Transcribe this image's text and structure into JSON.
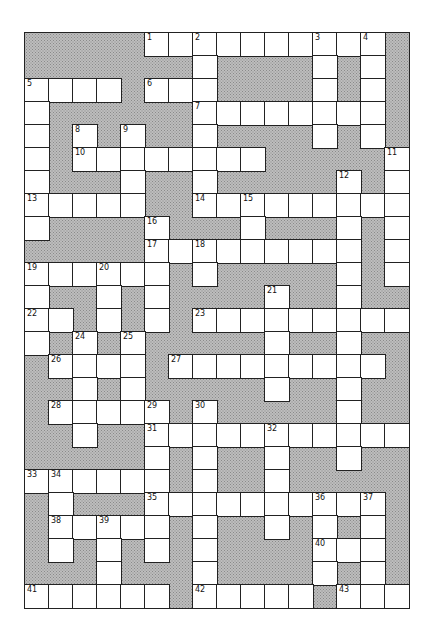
{
  "puzzle": {
    "type": "crossword",
    "rows": 25,
    "cols": 16,
    "colors": {
      "block": "#bdbdbd",
      "cell": "#ffffff",
      "line": "#222222"
    },
    "layout": [
      "#####..........#",
      "#######.####.#.#",
      "....#...####.#.#",
      ".######........#",
      ".#.#.##.####.#.#",
      ".#........#####.",
      ".###.##.#####.#.",
      ".....##.........",
      ".####.###.###.#.",
      "#####.........#.",
      "......#.#####.#.",
      ".##.#.####.##.##",
      "..#.#.#.........",
      ".#.#.#####.##.##",
      "#....#.........#",
      "##.#.#####.##.##",
      "#.....#.#####.##",
      "##.##...........",
      "#####.#.##.##.##",
      "......#.##.#####",
      "#.###..........#",
      "#.....#.##.#.#.#",
      "#.#.#.#.####...#",
      "###.###.####.#.#",
      "......#.....#..."
    ],
    "numbers": [
      {
        "n": "1",
        "r": 0,
        "c": 5
      },
      {
        "n": "2",
        "r": 0,
        "c": 7
      },
      {
        "n": "3",
        "r": 0,
        "c": 12
      },
      {
        "n": "4",
        "r": 0,
        "c": 14
      },
      {
        "n": "5",
        "r": 2,
        "c": 0
      },
      {
        "n": "6",
        "r": 2,
        "c": 5
      },
      {
        "n": "7",
        "r": 3,
        "c": 7
      },
      {
        "n": "8",
        "r": 4,
        "c": 2
      },
      {
        "n": "9",
        "r": 4,
        "c": 4
      },
      {
        "n": "10",
        "r": 5,
        "c": 2
      },
      {
        "n": "11",
        "r": 5,
        "c": 15
      },
      {
        "n": "12",
        "r": 6,
        "c": 13
      },
      {
        "n": "13",
        "r": 7,
        "c": 0
      },
      {
        "n": "14",
        "r": 7,
        "c": 7
      },
      {
        "n": "15",
        "r": 7,
        "c": 9
      },
      {
        "n": "16",
        "r": 8,
        "c": 5
      },
      {
        "n": "17",
        "r": 9,
        "c": 5
      },
      {
        "n": "18",
        "r": 9,
        "c": 7
      },
      {
        "n": "19",
        "r": 10,
        "c": 0
      },
      {
        "n": "20",
        "r": 10,
        "c": 3
      },
      {
        "n": "21",
        "r": 11,
        "c": 10
      },
      {
        "n": "22",
        "r": 12,
        "c": 0
      },
      {
        "n": "23",
        "r": 12,
        "c": 7
      },
      {
        "n": "24",
        "r": 13,
        "c": 2
      },
      {
        "n": "25",
        "r": 13,
        "c": 4
      },
      {
        "n": "26",
        "r": 14,
        "c": 1
      },
      {
        "n": "27",
        "r": 14,
        "c": 6
      },
      {
        "n": "28",
        "r": 16,
        "c": 1
      },
      {
        "n": "29",
        "r": 16,
        "c": 5
      },
      {
        "n": "30",
        "r": 16,
        "c": 7
      },
      {
        "n": "31",
        "r": 17,
        "c": 5
      },
      {
        "n": "32",
        "r": 17,
        "c": 10
      },
      {
        "n": "33",
        "r": 19,
        "c": 0
      },
      {
        "n": "34",
        "r": 19,
        "c": 1
      },
      {
        "n": "35",
        "r": 20,
        "c": 5
      },
      {
        "n": "36",
        "r": 20,
        "c": 12
      },
      {
        "n": "37",
        "r": 20,
        "c": 14
      },
      {
        "n": "38",
        "r": 21,
        "c": 1
      },
      {
        "n": "39",
        "r": 21,
        "c": 3
      },
      {
        "n": "40",
        "r": 22,
        "c": 12
      },
      {
        "n": "41",
        "r": 24,
        "c": 0
      },
      {
        "n": "42",
        "r": 24,
        "c": 7
      },
      {
        "n": "43",
        "r": 24,
        "c": 13
      }
    ]
  }
}
